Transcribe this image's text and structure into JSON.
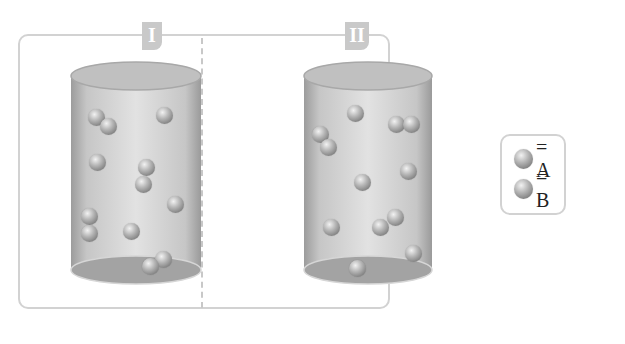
{
  "figure": {
    "containers": [
      {
        "label": "I",
        "particle_count": 16,
        "particles": [
          {
            "x": 96,
            "y": 117
          },
          {
            "x": 108,
            "y": 126
          },
          {
            "x": 164,
            "y": 115
          },
          {
            "x": 97,
            "y": 162
          },
          {
            "x": 146,
            "y": 167
          },
          {
            "x": 143,
            "y": 184
          },
          {
            "x": 175,
            "y": 204
          },
          {
            "x": 89,
            "y": 216
          },
          {
            "x": 89,
            "y": 233
          },
          {
            "x": 131,
            "y": 231
          },
          {
            "x": 163,
            "y": 259
          },
          {
            "x": 150,
            "y": 266
          }
        ]
      },
      {
        "label": "II",
        "particle_count": 12,
        "particles": [
          {
            "x": 355,
            "y": 113
          },
          {
            "x": 320,
            "y": 134
          },
          {
            "x": 328,
            "y": 147
          },
          {
            "x": 396,
            "y": 124
          },
          {
            "x": 411,
            "y": 124
          },
          {
            "x": 408,
            "y": 171
          },
          {
            "x": 362,
            "y": 182
          },
          {
            "x": 331,
            "y": 227
          },
          {
            "x": 380,
            "y": 227
          },
          {
            "x": 395,
            "y": 217
          },
          {
            "x": 413,
            "y": 253
          },
          {
            "x": 357,
            "y": 268
          }
        ]
      }
    ],
    "legend": {
      "items": [
        {
          "symbol": "sphere",
          "label": "= A"
        },
        {
          "symbol": "sphere",
          "label": "= B"
        }
      ]
    },
    "colors": {
      "frame_border": "#d2d2d2",
      "tab_fill": "#c9c9c9",
      "cylinder_body": "#c8c8c8",
      "cylinder_top": "#bdbdbd",
      "cylinder_bottom": "#9e9e9e",
      "particle": "#8a8a8a"
    }
  }
}
